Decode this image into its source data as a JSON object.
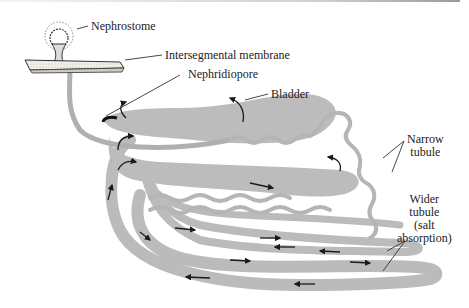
{
  "figure": {
    "colors": {
      "tubule_fill": "#b9b9b9",
      "tubule_dark": "#9a9a9a",
      "arrow": "#1a1a1a",
      "membrane_fill": "#f2f0ea",
      "label_text": "#222222",
      "leader_line": "#333333"
    }
  },
  "labels": {
    "nephrostome": "Nephrostome",
    "intersegmental_membrane": "Intersegmental membrane",
    "nephridiopore": "Nephridiopore",
    "bladder": "Bladder",
    "narrow_tubule_line1": "Narrow",
    "narrow_tubule_line2": "tubule",
    "wider_tubule_line1": "Wider",
    "wider_tubule_line2": "tubule",
    "wider_tubule_line3": "(salt",
    "wider_tubule_line4": "absorption)"
  }
}
